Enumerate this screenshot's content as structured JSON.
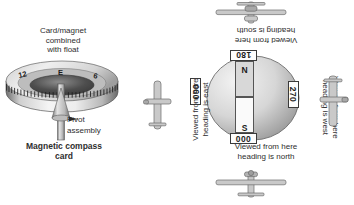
{
  "diagram": {
    "left": {
      "card_caption": "Card/magnet\ncombined\nwith float",
      "card_caption_lines": [
        "Card/magnet",
        "combined",
        "with float"
      ],
      "pivot_label_lines": [
        "Pivot",
        "assembly"
      ],
      "compass_card_title_lines": [
        "Magnetic compass",
        "card"
      ],
      "dial_marks": [
        "12",
        "E",
        "6"
      ],
      "icons": [
        "compass-card-icon",
        "pivot-assembly-icon"
      ]
    },
    "right": {
      "rose": {
        "north_label": "N",
        "south_label": "S",
        "headings": [
          {
            "name": "heading-180",
            "value": "180",
            "position": "top"
          },
          {
            "name": "heading-000",
            "value": "000",
            "position": "bottom"
          },
          {
            "name": "heading-090",
            "value": "090",
            "position": "left"
          },
          {
            "name": "heading-270",
            "value": "270",
            "position": "right"
          }
        ]
      },
      "viewpoints": [
        {
          "name": "viewed-north",
          "lines": [
            "Viewed from here",
            "heading is north"
          ],
          "position": "bottom"
        },
        {
          "name": "viewed-south",
          "lines": [
            "Viewed from here",
            "heading is south"
          ],
          "position": "top"
        },
        {
          "name": "viewed-east",
          "lines": [
            "Viewed from here",
            "heading is east"
          ],
          "position": "left"
        },
        {
          "name": "viewed-west",
          "lines": [
            "Viewed from here",
            "heading is west"
          ],
          "position": "right"
        }
      ],
      "icons": [
        "airplane-top-icon",
        "airplane-bottom-icon",
        "airplane-left-icon",
        "airplane-right-icon"
      ]
    },
    "colors": {
      "background": "#ffffff",
      "text": "#2e2e2e",
      "outline": "#555555",
      "magnet_north_fill": "#d8d8d8",
      "magnet_south_fill": "#fafafa",
      "metal_light": "#e6e6e6",
      "metal_dark": "#7a7a7a"
    }
  }
}
